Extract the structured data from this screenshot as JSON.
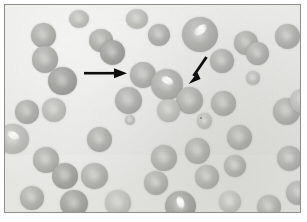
{
  "figure": {
    "title": "Peripheral blood smear photomicrograph",
    "modality": "light-microscopy",
    "staining": "grayscale halftone print",
    "frame": {
      "border_color": "#8e8e8a",
      "background_color": "#e9e9e6",
      "page_color": "#ffffff"
    },
    "corner_mark": "",
    "colors": {
      "background": "#e9e9e6",
      "cell_body": "#b0b0ad",
      "cell_rim": "#949491",
      "crystal_highlight": "#ffffff",
      "annotation": "#101010",
      "speck": "#6e6e6a"
    }
  },
  "annotations": {
    "arrows": [
      {
        "id": "arrow-left",
        "label": "horizontal arrow pointing right",
        "direction": "right",
        "x": 84,
        "y": 66,
        "length": 38,
        "points_to": "crystal-containing red cell at center-left"
      },
      {
        "id": "arrow-right",
        "label": "diagonal arrow pointing lower-left",
        "direction": "down-left",
        "x": 186,
        "y": 55,
        "length": 30,
        "points_to": "red cell below and left"
      }
    ],
    "speck": {
      "id": "dark-speck",
      "x": 200,
      "y": 117,
      "size": 2
    }
  },
  "cells": [
    {
      "id": "c1",
      "x": 26,
      "y": 18,
      "w": 25,
      "h": 25,
      "tone": "normal",
      "crystal": false
    },
    {
      "id": "c2",
      "x": 27,
      "y": 41,
      "w": 26,
      "h": 27,
      "tone": "normal",
      "crystal": false
    },
    {
      "id": "c3",
      "x": 43,
      "y": 62,
      "w": 29,
      "h": 28,
      "tone": "dark",
      "crystal": false
    },
    {
      "id": "c4",
      "x": 10,
      "y": 95,
      "w": 24,
      "h": 24,
      "tone": "normal",
      "crystal": false
    },
    {
      "id": "c5",
      "x": 37,
      "y": 93,
      "w": 24,
      "h": 24,
      "tone": "pale",
      "crystal": false
    },
    {
      "id": "c6",
      "x": -8,
      "y": 119,
      "w": 32,
      "h": 30,
      "tone": "pale",
      "crystal": true
    },
    {
      "id": "c7",
      "x": 28,
      "y": 142,
      "w": 26,
      "h": 26,
      "tone": "normal",
      "crystal": false
    },
    {
      "id": "c8",
      "x": 47,
      "y": 158,
      "w": 26,
      "h": 26,
      "tone": "dark",
      "crystal": false
    },
    {
      "id": "c9",
      "x": 15,
      "y": 181,
      "w": 24,
      "h": 24,
      "tone": "normal",
      "crystal": false
    },
    {
      "id": "c10",
      "x": 55,
      "y": 185,
      "w": 28,
      "h": 27,
      "tone": "dark",
      "crystal": false
    },
    {
      "id": "c11",
      "x": 84,
      "y": 24,
      "w": 24,
      "h": 23,
      "tone": "normal",
      "crystal": false
    },
    {
      "id": "c12",
      "x": 95,
      "y": 35,
      "w": 25,
      "h": 25,
      "tone": "dark",
      "crystal": false
    },
    {
      "id": "c13",
      "x": 125,
      "y": 57,
      "w": 26,
      "h": 26,
      "tone": "normal",
      "crystal": false
    },
    {
      "id": "c14",
      "x": 110,
      "y": 82,
      "w": 27,
      "h": 27,
      "tone": "normal",
      "crystal": false
    },
    {
      "id": "c15",
      "x": 82,
      "y": 122,
      "w": 25,
      "h": 25,
      "tone": "normal",
      "crystal": false
    },
    {
      "id": "c16",
      "x": 76,
      "y": 158,
      "w": 27,
      "h": 26,
      "tone": "normal",
      "crystal": false
    },
    {
      "id": "c17",
      "x": 100,
      "y": 185,
      "w": 26,
      "h": 26,
      "tone": "pale",
      "crystal": false
    },
    {
      "id": "c18",
      "x": 143,
      "y": 19,
      "w": 22,
      "h": 22,
      "tone": "normal",
      "crystal": false
    },
    {
      "id": "c19",
      "x": 146,
      "y": 64,
      "w": 32,
      "h": 31,
      "tone": "normal",
      "crystal": true
    },
    {
      "id": "c20",
      "x": 121,
      "y": 4,
      "w": 22,
      "h": 20,
      "tone": "pale",
      "crystal": false
    },
    {
      "id": "c21",
      "x": 177,
      "y": 12,
      "w": 36,
      "h": 35,
      "tone": "normal",
      "crystal": true
    },
    {
      "id": "c22",
      "x": 171,
      "y": 82,
      "w": 27,
      "h": 27,
      "tone": "normal",
      "crystal": false
    },
    {
      "id": "c23",
      "x": 152,
      "y": 94,
      "w": 23,
      "h": 23,
      "tone": "pale",
      "crystal": false
    },
    {
      "id": "c24",
      "x": 146,
      "y": 140,
      "w": 26,
      "h": 26,
      "tone": "normal",
      "crystal": false
    },
    {
      "id": "c25",
      "x": 180,
      "y": 133,
      "w": 25,
      "h": 26,
      "tone": "normal",
      "crystal": false
    },
    {
      "id": "c26",
      "x": 192,
      "y": 108,
      "w": 15,
      "h": 16,
      "tone": "pale",
      "crystal": false
    },
    {
      "id": "c27",
      "x": 139,
      "y": 166,
      "w": 24,
      "h": 24,
      "tone": "normal",
      "crystal": false
    },
    {
      "id": "c28",
      "x": 160,
      "y": 186,
      "w": 31,
      "h": 30,
      "tone": "dark",
      "crystal": true
    },
    {
      "id": "c29",
      "x": 205,
      "y": 44,
      "w": 24,
      "h": 24,
      "tone": "normal",
      "crystal": false
    },
    {
      "id": "c30",
      "x": 206,
      "y": 86,
      "w": 25,
      "h": 25,
      "tone": "normal",
      "crystal": false
    },
    {
      "id": "c31",
      "x": 222,
      "y": 120,
      "w": 25,
      "h": 25,
      "tone": "normal",
      "crystal": false
    },
    {
      "id": "c32",
      "x": 190,
      "y": 160,
      "w": 24,
      "h": 24,
      "tone": "normal",
      "crystal": false
    },
    {
      "id": "c33",
      "x": 219,
      "y": 150,
      "w": 22,
      "h": 22,
      "tone": "normal",
      "crystal": false
    },
    {
      "id": "c34",
      "x": 229,
      "y": 26,
      "w": 24,
      "h": 24,
      "tone": "normal",
      "crystal": false
    },
    {
      "id": "c35",
      "x": 241,
      "y": 37,
      "w": 23,
      "h": 23,
      "tone": "normal",
      "crystal": false
    },
    {
      "id": "c36",
      "x": 270,
      "y": 19,
      "w": 25,
      "h": 25,
      "tone": "normal",
      "crystal": false
    },
    {
      "id": "c37",
      "x": 268,
      "y": 93,
      "w": 27,
      "h": 27,
      "tone": "normal",
      "crystal": false
    },
    {
      "id": "c38",
      "x": 285,
      "y": 84,
      "w": 24,
      "h": 24,
      "tone": "pale",
      "crystal": false
    },
    {
      "id": "c39",
      "x": 272,
      "y": 141,
      "w": 25,
      "h": 25,
      "tone": "normal",
      "crystal": false
    },
    {
      "id": "c40",
      "x": 281,
      "y": 176,
      "w": 24,
      "h": 24,
      "tone": "normal",
      "crystal": false
    },
    {
      "id": "c41",
      "x": 252,
      "y": 190,
      "w": 24,
      "h": 24,
      "tone": "normal",
      "crystal": false
    },
    {
      "id": "c42",
      "x": 214,
      "y": 186,
      "w": 22,
      "h": 22,
      "tone": "pale",
      "crystal": false
    },
    {
      "id": "c43",
      "x": 120,
      "y": 110,
      "w": 10,
      "h": 10,
      "tone": "pale",
      "crystal": false
    },
    {
      "id": "c44",
      "x": 64,
      "y": 5,
      "w": 20,
      "h": 18,
      "tone": "pale",
      "crystal": false
    },
    {
      "id": "c45",
      "x": 241,
      "y": 66,
      "w": 14,
      "h": 14,
      "tone": "pale",
      "crystal": false
    }
  ]
}
